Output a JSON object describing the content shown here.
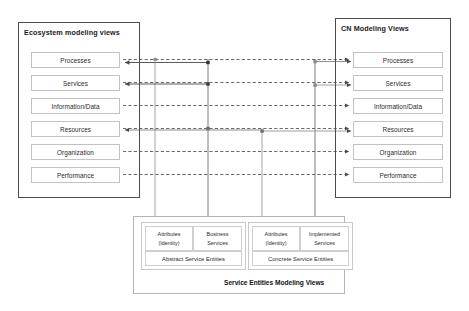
{
  "diagram": {
    "title_left": "Ecosystem modeling views",
    "title_right": "CN Modeling Views",
    "bottom_caption": "Service Entities Modeling Views",
    "view_rows": [
      "Processes",
      "Services",
      "Information/Data",
      "Resources",
      "Organization",
      "Performance"
    ],
    "left_rows": [
      "Processes",
      "Services",
      "Information/Data",
      "Resources",
      "Organization",
      "Performance"
    ],
    "right_rows": [
      "Processes",
      "Services",
      "Information/Data",
      "Resources",
      "Organization",
      "Performance"
    ],
    "abstract_group": {
      "caption": "Abstract Service Entities",
      "cells": [
        {
          "line1": "Attributes",
          "line2": "(Identity)"
        },
        {
          "line1": "Business",
          "line2": "Services"
        }
      ]
    },
    "concrete_group": {
      "caption": "Concrete Service Entities",
      "cells": [
        {
          "line1": "Attributes",
          "line2": "(Identity)"
        },
        {
          "line1": "Implemented",
          "line2": "Services"
        }
      ]
    },
    "colors": {
      "panel_border": "#4d4d4d",
      "box_border": "#c2c2c2",
      "wire": "#6e6e6e",
      "wire_dashed": "#595959",
      "text": "#2b2b2b"
    }
  }
}
